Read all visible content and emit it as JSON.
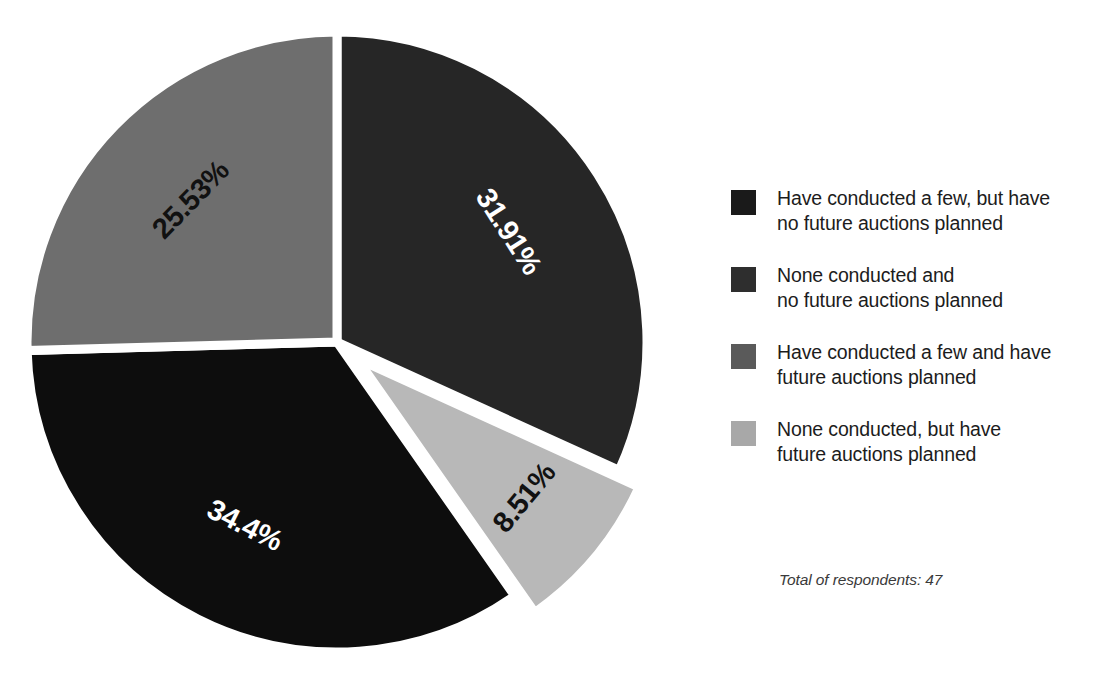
{
  "chart_data": {
    "type": "pie",
    "title": "",
    "subtitle": "",
    "xlabel": "",
    "ylabel": "",
    "grid": false,
    "legend_position": "right",
    "start_angle_deg": 0,
    "direction": "clockwise",
    "categories": [
      "Have conducted a few, but have no future auctions planned",
      "None conducted and no future auctions planned",
      "Have conducted a few and have future auctions planned",
      "None conducted, but have future auctions planned"
    ],
    "values": [
      31.91,
      34.4,
      25.53,
      8.51
    ],
    "value_labels": [
      "31.91%",
      "34.4%",
      "25.53%",
      "8.51%"
    ],
    "colors": [
      "#262626",
      "#0d0d0d",
      "#6e6e6e",
      "#b8b8b8"
    ],
    "slices": [
      {
        "label": "31.91%",
        "value": 31.91,
        "category": "Have conducted a few, but have no future auctions planned",
        "color": "#262626",
        "label_color": "#ffffff",
        "exploded": false
      },
      {
        "label": "8.51%",
        "value": 8.51,
        "category": "None conducted, but have future auctions planned",
        "color": "#b8b8b8",
        "label_color": "#111111",
        "exploded": true
      },
      {
        "label": "34.4%",
        "value": 34.4,
        "category": "None conducted and no future auctions planned",
        "color": "#0d0d0d",
        "label_color": "#ffffff",
        "exploded": false
      },
      {
        "label": "25.53%",
        "value": 25.53,
        "category": "Have conducted a few and have future auctions planned",
        "color": "#6e6e6e",
        "label_color": "#111111",
        "exploded": false
      }
    ],
    "total_respondents": 47,
    "annotations": [
      "Total of respondents: 47"
    ]
  },
  "legend": {
    "items": [
      {
        "label": "Have conducted a few, but have\nno future auctions planned",
        "color": "#1a1a1a"
      },
      {
        "label": "None conducted and\nno future auctions planned",
        "color": "#2e2e2e"
      },
      {
        "label": "Have conducted a few and have\nfuture auctions planned",
        "color": "#5a5a5a"
      },
      {
        "label": "None conducted, but have\nfuture auctions planned",
        "color": "#a8a8a8"
      }
    ]
  },
  "footnote": {
    "text": "Total of respondents: 47"
  }
}
